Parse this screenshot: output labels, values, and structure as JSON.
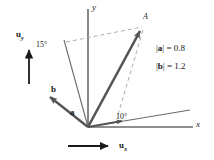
{
  "figure": {
    "type": "vector-diagram",
    "background_color": "#ffffff",
    "line_color": "#555555",
    "dash_color": "#9a9a9a",
    "text_color": "#1a1a1a",
    "width": 214,
    "height": 160
  },
  "axes": {
    "x_label": "x",
    "y_label": "y",
    "origin": [
      88,
      127
    ],
    "x_axis_end": [
      192,
      127
    ],
    "y_axis_end": [
      88,
      10
    ]
  },
  "point": {
    "label": "A",
    "position": [
      145,
      25
    ]
  },
  "vectors": [
    {
      "name": "a",
      "label": "a",
      "magnitude_label": "|a| = 0.8",
      "magnitude_value": 0.8,
      "angle_from_x_axis_deg": 10,
      "tip": [
        128,
        120
      ],
      "label_pos": [
        72,
        112
      ]
    },
    {
      "name": "b",
      "label": "b",
      "magnitude_label": "|b| = 1.2",
      "magnitude_value": 1.2,
      "angle_from_y_axis_deg": 15,
      "tip": [
        47,
        93
      ],
      "label_pos": [
        49,
        89
      ]
    },
    {
      "name": "resultant",
      "label": "",
      "tip": [
        145,
        25
      ]
    }
  ],
  "angles": [
    {
      "label": "15°",
      "value_deg": 15,
      "measured_from": "y-axis",
      "pos": [
        40,
        44
      ]
    },
    {
      "label": "10°",
      "value_deg": 10,
      "measured_from": "x-axis",
      "pos": [
        118,
        116
      ]
    }
  ],
  "magnitudes": [
    {
      "symbol": "a",
      "text": "= 0.8",
      "full": "|a| = 0.8"
    },
    {
      "symbol": "b",
      "text": "= 1.2",
      "full": "|b| = 1.2"
    }
  ],
  "unit_vectors": [
    {
      "name": "u_y",
      "base": "u",
      "sub": "y",
      "direction": "vertical-up",
      "arrow_pos": [
        28,
        55
      ]
    },
    {
      "name": "u_x",
      "base": "u",
      "sub": "x",
      "direction": "horizontal-right",
      "arrow_pos": [
        60,
        146
      ]
    }
  ]
}
